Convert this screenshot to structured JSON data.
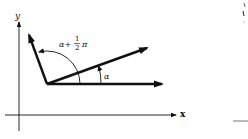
{
  "diagram": {
    "axes": {
      "x_label": "x",
      "y_label": "y"
    },
    "vectors": [
      {
        "name": "reference-vector",
        "description": "horizontal vector along positive x direction"
      },
      {
        "name": "vector-at-alpha",
        "description": "vector rotated by angle alpha"
      },
      {
        "name": "vector-at-alpha-plus-half-pi",
        "description": "vector rotated by alpha + pi/2"
      }
    ],
    "angles": {
      "alpha_label": "α",
      "alpha_plus_half_pi": {
        "prefix": "α+",
        "frac_num": "1",
        "frac_den": "2",
        "suffix": "π"
      }
    },
    "colors": {
      "ink": "#111111",
      "background": "#ffffff"
    }
  }
}
